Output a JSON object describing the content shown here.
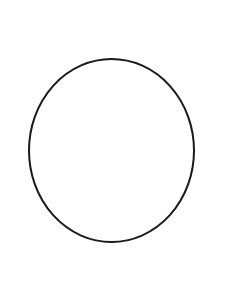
{
  "canvas": {
    "width": 234,
    "height": 281,
    "background": "#ffffff"
  },
  "shape": {
    "type": "ellipse",
    "cx": 111.5,
    "cy": 150.5,
    "rx": 82.5,
    "ry": 91.5,
    "stroke": "#1a1a1a",
    "stroke_width": 2,
    "fill": "none"
  }
}
